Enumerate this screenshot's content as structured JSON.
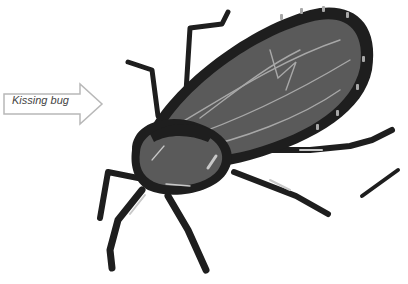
{
  "label": {
    "text": "Kissing bug"
  },
  "colors": {
    "body": "#5a5a5a",
    "outline": "#1e1e1e",
    "vein": "#a8a8a8",
    "arrow_stroke": "#b8b8b8"
  }
}
